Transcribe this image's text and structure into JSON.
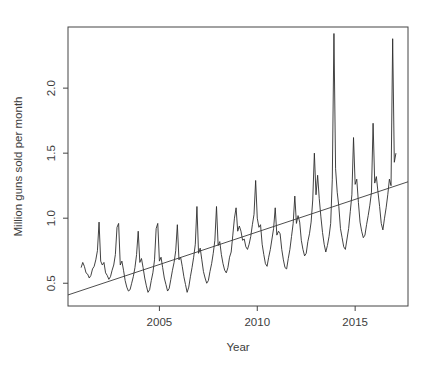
{
  "figure": {
    "kind": "r-base-plot",
    "background": "#ffffff"
  },
  "chart_data": {
    "type": "line",
    "title": "",
    "xlabel": "Year",
    "ylabel": "Million guns sold per month",
    "xlim": [
      2000.33,
      2017.7
    ],
    "ylim": [
      0.325,
      2.47
    ],
    "x_ticks": [
      2005,
      2010,
      2015
    ],
    "y_ticks": [
      0.5,
      1.0,
      1.5,
      2.0
    ],
    "grid": false,
    "legend": "none",
    "colors": {
      "series_line": "#2e2e2e",
      "trend_line": "#3a3a3a",
      "axis": "#444444",
      "text": "#3d3d3d",
      "background": "#ffffff"
    },
    "series": [
      {
        "name": "monthly-gun-sales",
        "type": "line",
        "start": 2001.0,
        "frequency": 12,
        "values": [
          0.62,
          0.66,
          0.63,
          0.58,
          0.57,
          0.54,
          0.56,
          0.61,
          0.63,
          0.68,
          0.75,
          0.97,
          0.67,
          0.64,
          0.66,
          0.58,
          0.56,
          0.53,
          0.55,
          0.6,
          0.64,
          0.72,
          0.93,
          0.96,
          0.64,
          0.67,
          0.6,
          0.52,
          0.47,
          0.44,
          0.45,
          0.5,
          0.55,
          0.62,
          0.72,
          0.9,
          0.66,
          0.69,
          0.62,
          0.54,
          0.48,
          0.43,
          0.45,
          0.52,
          0.58,
          0.68,
          0.92,
          0.96,
          0.67,
          0.7,
          0.62,
          0.54,
          0.49,
          0.44,
          0.46,
          0.53,
          0.6,
          0.66,
          0.75,
          0.95,
          0.68,
          0.7,
          0.63,
          0.55,
          0.49,
          0.43,
          0.47,
          0.55,
          0.62,
          0.7,
          0.8,
          1.09,
          0.73,
          0.77,
          0.68,
          0.59,
          0.54,
          0.5,
          0.52,
          0.59,
          0.65,
          0.73,
          0.83,
          1.09,
          0.79,
          0.82,
          0.72,
          0.65,
          0.6,
          0.58,
          0.62,
          0.7,
          0.74,
          0.87,
          1.0,
          1.08,
          0.9,
          0.94,
          0.9,
          0.83,
          0.84,
          0.78,
          0.76,
          0.8,
          0.86,
          0.95,
          1.03,
          1.29,
          1.0,
          0.93,
          0.95,
          0.8,
          0.72,
          0.65,
          0.63,
          0.7,
          0.76,
          0.84,
          0.92,
          1.08,
          0.87,
          0.9,
          0.88,
          0.76,
          0.68,
          0.62,
          0.61,
          0.69,
          0.76,
          0.86,
          0.96,
          1.17,
          0.96,
          1.02,
          0.97,
          0.83,
          0.76,
          0.71,
          0.73,
          0.82,
          0.88,
          0.97,
          1.14,
          1.5,
          1.18,
          1.33,
          1.15,
          1.01,
          0.89,
          0.8,
          0.74,
          0.79,
          0.86,
          0.96,
          1.3,
          2.42,
          1.38,
          1.2,
          1.09,
          0.92,
          0.85,
          0.78,
          0.76,
          0.84,
          0.92,
          1.05,
          1.18,
          1.62,
          1.26,
          1.3,
          1.12,
          0.97,
          0.9,
          0.85,
          0.87,
          0.95,
          1.02,
          1.1,
          1.2,
          1.73,
          1.27,
          1.32,
          1.2,
          1.09,
          0.96,
          0.91,
          1.0,
          1.08,
          1.18,
          1.3,
          1.25,
          2.38,
          1.43,
          1.5
        ]
      },
      {
        "name": "linear-trend",
        "type": "straight-line",
        "x": [
          2000.33,
          2017.7
        ],
        "y": [
          0.41,
          1.28
        ]
      }
    ]
  }
}
